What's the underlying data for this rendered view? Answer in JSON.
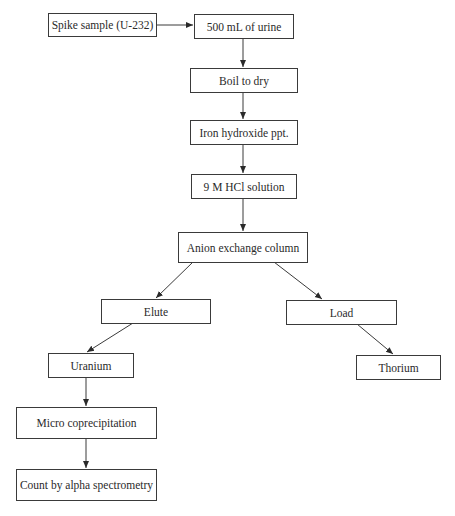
{
  "diagram": {
    "type": "flowchart",
    "nodes": [
      {
        "id": "spike",
        "label": "Spike sample (U-232)"
      },
      {
        "id": "urine",
        "label": "500 mL of urine"
      },
      {
        "id": "boil",
        "label": "Boil to dry"
      },
      {
        "id": "iron",
        "label": "Iron hydroxide ppt."
      },
      {
        "id": "hcl",
        "label": "9 M HCl solution"
      },
      {
        "id": "anion",
        "label": "Anion exchange column"
      },
      {
        "id": "elute",
        "label": "Elute"
      },
      {
        "id": "load",
        "label": "Load"
      },
      {
        "id": "uranium",
        "label": "Uranium"
      },
      {
        "id": "thorium",
        "label": "Thorium"
      },
      {
        "id": "micro",
        "label": "Micro coprecipitation"
      },
      {
        "id": "count",
        "label": "Count by alpha spectrometry"
      }
    ],
    "edges": [
      {
        "from": "spike",
        "to": "urine"
      },
      {
        "from": "urine",
        "to": "boil"
      },
      {
        "from": "boil",
        "to": "iron"
      },
      {
        "from": "iron",
        "to": "hcl"
      },
      {
        "from": "hcl",
        "to": "anion"
      },
      {
        "from": "anion",
        "to": "elute"
      },
      {
        "from": "anion",
        "to": "load"
      },
      {
        "from": "elute",
        "to": "uranium"
      },
      {
        "from": "load",
        "to": "thorium"
      },
      {
        "from": "uranium",
        "to": "micro"
      },
      {
        "from": "micro",
        "to": "count"
      }
    ]
  }
}
